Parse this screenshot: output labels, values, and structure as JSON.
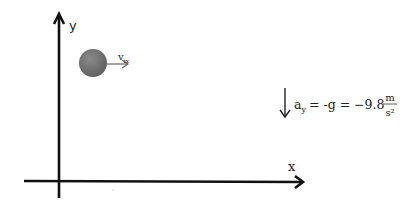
{
  "diagram": {
    "axes": {
      "y_label": "y",
      "x_label": "x"
    },
    "ball": {
      "velocity_label_main": "v",
      "velocity_label_sub": "ix",
      "color": "#777777"
    },
    "acceleration": {
      "lhs_main": "a",
      "lhs_sub": "y",
      "rest": "= -g = −9.8",
      "units_num": "m",
      "units_den": "s²"
    }
  }
}
